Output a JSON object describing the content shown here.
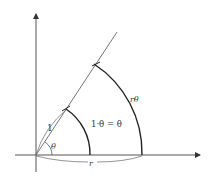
{
  "diagram": {
    "type": "arc-length-radian-diagram",
    "colors": {
      "background": "#ffffff",
      "axes": "#444444",
      "ray": "#555555",
      "arcs": "#222222",
      "text": "#333333"
    },
    "labels": {
      "unit_radius": "1",
      "angle": "θ",
      "unit_arc": "1·θ = θ",
      "outer_arc": "rθ",
      "outer_radius": "r"
    }
  }
}
